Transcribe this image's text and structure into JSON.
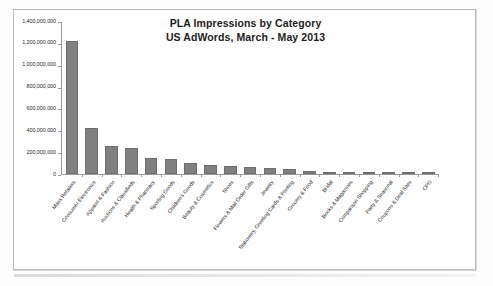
{
  "chart_data": {
    "type": "bar",
    "title": "PLA Impressions by Category",
    "subtitle": "US AdWords, March - May 2013",
    "xlabel": "",
    "ylabel": "",
    "ylim": [
      0,
      1400000000
    ],
    "grid": false,
    "legend": null,
    "orientation": "vertical",
    "bar_color": "#808080",
    "y_ticks": [
      "1,400,000,000",
      "1,200,000,000",
      "1,000,000,000",
      "800,000,000",
      "600,000,000",
      "400,000,000",
      "200,000,000",
      "0"
    ],
    "y_tick_values": [
      1400000000,
      1200000000,
      1000000000,
      800000000,
      600000000,
      400000000,
      200000000,
      0
    ],
    "categories": [
      "Mass Retailers",
      "Consumer Electronics",
      "Apparel & Fashion",
      "Auctions & Classifieds",
      "Health & Pharmacy",
      "Sporting Goods",
      "Children's Goods",
      "Beauty & Cosmetics",
      "Shoes",
      "Flowers & Mail Order Gifts",
      "Jewelry",
      "Stationery, Greeting Cards & Printing",
      "Grocery & Food",
      "Bridal",
      "Books & Magazines",
      "Comparison Shopping",
      "Party & Seasonal",
      "Coupons & Deal Sites",
      "CPG"
    ],
    "values": [
      1215000000,
      425000000,
      260000000,
      235000000,
      150000000,
      138000000,
      105000000,
      82000000,
      75000000,
      65000000,
      52000000,
      42000000,
      25000000,
      20000000,
      18000000,
      14000000,
      13000000,
      3000000,
      2000000
    ]
  }
}
